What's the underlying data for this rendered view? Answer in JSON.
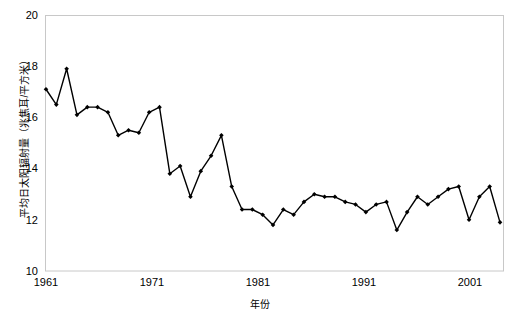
{
  "chart_data": {
    "type": "line",
    "title": "",
    "xlabel": "年份",
    "ylabel": "平均日太阳辐射量（兆焦耳/平方米）",
    "xlim": [
      1961,
      2005
    ],
    "ylim": [
      10,
      20
    ],
    "ytick_labels": [
      "20",
      "18",
      "16",
      "14",
      "12",
      "10"
    ],
    "ytick_values": [
      20,
      18,
      16,
      14,
      12,
      10
    ],
    "xtick_labels": [
      "1961",
      "1971",
      "1981",
      "1991",
      "2001"
    ],
    "xtick_values": [
      1961,
      1971,
      1981,
      1991,
      2001
    ],
    "grid": false,
    "legend": "none",
    "marker": "filled-diamond",
    "line_color": "#000000",
    "marker_color": "#000000",
    "frame_color": "#c8c8c8",
    "background": "#ffffff",
    "x": [
      1961,
      1962,
      1963,
      1964,
      1965,
      1966,
      1967,
      1968,
      1969,
      1970,
      1971,
      1972,
      1973,
      1974,
      1975,
      1976,
      1977,
      1978,
      1979,
      1980,
      1981,
      1982,
      1983,
      1984,
      1985,
      1986,
      1987,
      1988,
      1989,
      1990,
      1991,
      1992,
      1993,
      1994,
      1995,
      1996,
      1997,
      1998,
      1999,
      2000,
      2001,
      2002,
      2003,
      2004,
      2005
    ],
    "values": [
      17.1,
      16.5,
      17.9,
      16.1,
      16.4,
      16.4,
      16.2,
      15.3,
      15.5,
      15.4,
      16.2,
      16.4,
      13.8,
      14.1,
      12.9,
      13.9,
      14.5,
      15.3,
      13.3,
      12.4,
      12.4,
      12.2,
      11.8,
      12.4,
      12.2,
      12.7,
      13.0,
      12.9,
      12.9,
      12.7,
      12.6,
      12.3,
      12.6,
      12.7,
      11.6,
      12.3,
      12.9,
      12.6,
      12.9,
      13.2,
      13.3,
      12.0,
      12.9,
      13.3,
      11.9
    ],
    "series_name": "平均日太阳辐射量"
  }
}
